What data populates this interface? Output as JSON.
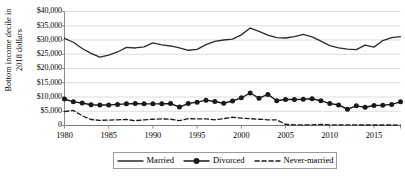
{
  "chart_data": {
    "type": "line",
    "title": "",
    "xlabel": "",
    "ylabel": "Bottom income decile in 2018 dollars",
    "ylabel_line1": "Bottom income decile in",
    "ylabel_line2": "2018 dollars",
    "xlim": [
      1980,
      2018
    ],
    "ylim": [
      0,
      40000
    ],
    "grid": true,
    "grid_axis": "y",
    "legend_position": "bottom-center",
    "y_ticks": [
      0,
      5000,
      10000,
      15000,
      20000,
      25000,
      30000,
      35000,
      40000
    ],
    "y_tick_labels": [
      "0",
      "$5,000",
      "$10,000",
      "$15,000",
      "$20,000",
      "$25,000",
      "$30,000",
      "$35,000",
      "$40,000"
    ],
    "x_ticks": [
      1980,
      1985,
      1990,
      1995,
      2000,
      2005,
      2010,
      2015
    ],
    "x_tick_labels": [
      "1980",
      "1985",
      "1990",
      "1995",
      "2000",
      "2005",
      "2010",
      "2015"
    ],
    "x": [
      1980,
      1981,
      1982,
      1983,
      1984,
      1985,
      1986,
      1987,
      1988,
      1989,
      1990,
      1991,
      1992,
      1993,
      1994,
      1995,
      1996,
      1997,
      1998,
      1999,
      2000,
      2001,
      2002,
      2003,
      2004,
      2005,
      2006,
      2007,
      2008,
      2009,
      2010,
      2011,
      2012,
      2013,
      2014,
      2015,
      2016,
      2017,
      2018
    ],
    "series": [
      {
        "name": "Married",
        "style": "solid",
        "marker": "none",
        "color": "#2b2b2b",
        "values": [
          30600,
          29200,
          27000,
          25300,
          24000,
          24700,
          25800,
          27400,
          27200,
          27600,
          29000,
          28300,
          27900,
          27200,
          26400,
          26700,
          28400,
          29500,
          30000,
          30300,
          31800,
          34200,
          33000,
          31700,
          30800,
          30700,
          31200,
          32000,
          31100,
          29600,
          28000,
          27200,
          26800,
          26600,
          28200,
          27500,
          29800,
          30800,
          31200
        ]
      },
      {
        "name": "Divorced",
        "style": "solid",
        "marker": "circle",
        "color": "#1a1a1a",
        "values": [
          9300,
          8300,
          7900,
          7300,
          7200,
          7200,
          7400,
          7600,
          7700,
          7600,
          7600,
          7600,
          7700,
          6500,
          7700,
          8200,
          8900,
          8400,
          7800,
          8600,
          9700,
          11400,
          9600,
          10900,
          8700,
          9100,
          9100,
          9200,
          9400,
          8700,
          7700,
          7200,
          5700,
          6900,
          6400,
          7000,
          7100,
          7400,
          8300
        ]
      },
      {
        "name": "Never-married",
        "style": "dashed",
        "marker": "none",
        "color": "#1a1a1a",
        "values": [
          4900,
          5300,
          3400,
          2100,
          1800,
          1900,
          2000,
          2100,
          1700,
          2000,
          2200,
          2300,
          2200,
          1700,
          2400,
          2300,
          2300,
          2000,
          2400,
          2900,
          2600,
          2400,
          2200,
          2000,
          2000,
          400,
          250,
          200,
          200,
          380,
          250,
          200,
          200,
          200,
          180,
          180,
          170,
          170,
          160
        ]
      }
    ]
  },
  "legend": {
    "items": [
      {
        "label": "Married"
      },
      {
        "label": "Divorced"
      },
      {
        "label": "Never-married"
      }
    ]
  }
}
